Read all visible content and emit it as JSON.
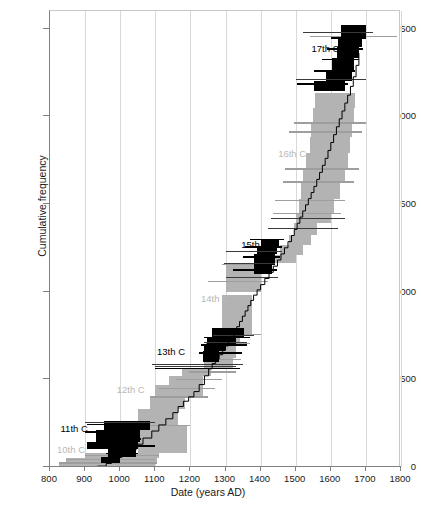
{
  "chart_data": {
    "type": "line",
    "title": "",
    "xlabel": "Date (years AD)",
    "ylabel": "Cumulative frequency",
    "xlim": [
      800,
      1800
    ],
    "ylim": [
      0,
      2600
    ],
    "xticks": [
      800,
      900,
      1000,
      1100,
      1200,
      1300,
      1400,
      1500,
      1600,
      1700,
      1800
    ],
    "yticks": [
      0,
      500,
      1000,
      1500,
      2000,
      2500
    ],
    "grid": "vertical",
    "legend": "none",
    "series": [
      {
        "name": "Cumulative frequency step curve",
        "color": "#000000",
        "x": [
          935,
          960,
          975,
          990,
          1005,
          1020,
          1045,
          1065,
          1090,
          1110,
          1130,
          1150,
          1165,
          1180,
          1195,
          1210,
          1225,
          1240,
          1252,
          1262,
          1272,
          1282,
          1292,
          1300,
          1308,
          1316,
          1324,
          1332,
          1340,
          1348,
          1356,
          1364,
          1372,
          1380,
          1390,
          1400,
          1412,
          1424,
          1436,
          1448,
          1458,
          1468,
          1478,
          1488,
          1496,
          1504,
          1512,
          1520,
          1528,
          1536,
          1544,
          1552,
          1560,
          1568,
          1576,
          1584,
          1592,
          1600,
          1608,
          1616,
          1624,
          1632,
          1640,
          1648,
          1656,
          1664,
          1672,
          1680
        ],
        "y": [
          5,
          20,
          35,
          55,
          75,
          95,
          130,
          165,
          205,
          240,
          275,
          310,
          345,
          375,
          400,
          430,
          470,
          520,
          560,
          590,
          615,
          640,
          665,
          690,
          715,
          740,
          770,
          800,
          830,
          860,
          890,
          920,
          950,
          980,
          1010,
          1040,
          1075,
          1110,
          1145,
          1180,
          1215,
          1250,
          1285,
          1320,
          1355,
          1390,
          1425,
          1460,
          1495,
          1530,
          1565,
          1600,
          1640,
          1680,
          1720,
          1760,
          1805,
          1850,
          1895,
          1940,
          1985,
          2030,
          2075,
          2120,
          2170,
          2225,
          2290,
          2360
        ]
      }
    ],
    "uncertainty_band": {
      "name": "Calibration uncertainty envelope",
      "color": "#b3b3b3",
      "description": "Grey vertical envelope surrounding the cumulative step curve"
    },
    "error_bars": {
      "black": {
        "color": "#000000",
        "description": "Black horizontal date-range bars and blocks for odd centuries"
      },
      "grey": {
        "color": "#9e9e9e",
        "description": "Grey horizontal date-range bars and blocks for even centuries"
      }
    },
    "annotations": [
      {
        "label": "10th C",
        "x": 820,
        "y": 105,
        "tone": "light"
      },
      {
        "label": "11th C",
        "x": 830,
        "y": 222,
        "tone": "dark"
      },
      {
        "label": "12th C",
        "x": 990,
        "y": 442,
        "tone": "light"
      },
      {
        "label": "13th C",
        "x": 1105,
        "y": 662,
        "tone": "dark"
      },
      {
        "label": "14th C",
        "x": 1230,
        "y": 965,
        "tone": "light"
      },
      {
        "label": "15th C",
        "x": 1345,
        "y": 1272,
        "tone": "dark"
      },
      {
        "label": "16th C",
        "x": 1450,
        "y": 1790,
        "tone": "light"
      },
      {
        "label": "17th C",
        "x": 1545,
        "y": 2390,
        "tone": "dark"
      }
    ]
  }
}
